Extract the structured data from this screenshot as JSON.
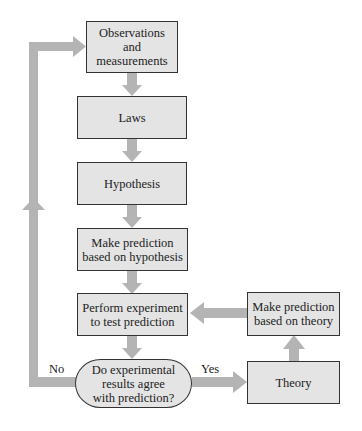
{
  "diagram": {
    "nodes": {
      "observations": "Observations\nand\nmeasurements",
      "laws": "Laws",
      "hypothesis": "Hypothesis",
      "predict_hypothesis": "Make prediction\nbased on hypothesis",
      "experiment": "Perform experiment\nto test prediction",
      "decision": "Do experimental\nresults agree\nwith prediction?",
      "theory": "Theory",
      "predict_theory": "Make prediction\nbased on theory"
    },
    "edge_labels": {
      "no": "No",
      "yes": "Yes"
    },
    "colors": {
      "box_fill": "#e4e4e4",
      "arrow": "#b4b4b4",
      "border": "#333333"
    }
  }
}
